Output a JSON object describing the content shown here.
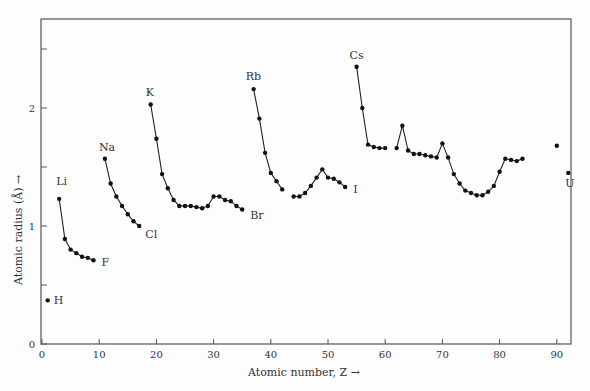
{
  "chart_data": {
    "type": "line",
    "title": "",
    "xlabel": "Atomic number, Z →",
    "ylabel": "Atomic radius (Å) →",
    "xlim": [
      0,
      93
    ],
    "ylim": [
      0,
      2.7
    ],
    "xticks": [
      0,
      10,
      20,
      30,
      40,
      50,
      60,
      70,
      80,
      90
    ],
    "yticks": [
      0,
      0.5,
      1,
      1.5,
      2,
      2.5
    ],
    "ytick_labels": [
      "0",
      "",
      "1",
      "",
      "2",
      ""
    ],
    "grid": false,
    "legend": null,
    "series": [
      {
        "name": "H",
        "x": [
          1
        ],
        "y": [
          0.37
        ]
      },
      {
        "name": "Li-F",
        "x": [
          3,
          4,
          5,
          6,
          7,
          8,
          9
        ],
        "y": [
          1.23,
          0.89,
          0.8,
          0.77,
          0.74,
          0.73,
          0.71
        ]
      },
      {
        "name": "Na-Cl",
        "x": [
          11,
          12,
          13,
          14,
          15,
          16,
          17
        ],
        "y": [
          1.57,
          1.36,
          1.25,
          1.17,
          1.1,
          1.04,
          1.0
        ]
      },
      {
        "name": "K-Br",
        "x": [
          19,
          20,
          21,
          22,
          23,
          24,
          25,
          26,
          27,
          28,
          29,
          30,
          31,
          32,
          33,
          34,
          35
        ],
        "y": [
          2.03,
          1.74,
          1.44,
          1.32,
          1.22,
          1.17,
          1.17,
          1.17,
          1.16,
          1.15,
          1.17,
          1.25,
          1.25,
          1.22,
          1.21,
          1.17,
          1.14
        ]
      },
      {
        "name": "Rb-Mo",
        "x": [
          37,
          38,
          39,
          40,
          41,
          42
        ],
        "y": [
          2.16,
          1.91,
          1.62,
          1.45,
          1.38,
          1.31
        ]
      },
      {
        "name": "Ru-I",
        "x": [
          44,
          45,
          46,
          47,
          48,
          49,
          50,
          51,
          52,
          53
        ],
        "y": [
          1.25,
          1.25,
          1.28,
          1.34,
          1.41,
          1.48,
          1.41,
          1.4,
          1.37,
          1.33
        ]
      },
      {
        "name": "Cs-Nd",
        "x": [
          55,
          56,
          57,
          58,
          59,
          60
        ],
        "y": [
          2.35,
          2.0,
          1.69,
          1.67,
          1.66,
          1.66
        ]
      },
      {
        "name": "Sm-Po",
        "x": [
          62,
          63,
          64,
          65,
          66,
          67,
          68,
          69,
          70,
          71,
          72,
          73,
          74,
          75,
          76,
          77,
          78,
          79,
          80,
          81,
          82,
          83,
          84
        ],
        "y": [
          1.66,
          1.85,
          1.64,
          1.61,
          1.61,
          1.6,
          1.59,
          1.58,
          1.7,
          1.58,
          1.44,
          1.36,
          1.3,
          1.28,
          1.26,
          1.26,
          1.29,
          1.34,
          1.46,
          1.57,
          1.56,
          1.55,
          1.57
        ]
      },
      {
        "name": "Th",
        "x": [
          90
        ],
        "y": [
          1.68
        ]
      },
      {
        "name": "U",
        "x": [
          92
        ],
        "y": [
          1.45
        ]
      }
    ],
    "annotations": [
      {
        "text": "H",
        "x": 1,
        "y": 0.37
      },
      {
        "text": "Li",
        "x": 3,
        "y": 1.23
      },
      {
        "text": "F",
        "x": 9,
        "y": 0.71
      },
      {
        "text": "Na",
        "x": 11,
        "y": 1.57
      },
      {
        "text": "Cl",
        "x": 17,
        "y": 1.0
      },
      {
        "text": "K",
        "x": 19,
        "y": 2.03
      },
      {
        "text": "Br",
        "x": 35,
        "y": 1.14
      },
      {
        "text": "Rb",
        "x": 37,
        "y": 2.16
      },
      {
        "text": "I",
        "x": 53,
        "y": 1.33
      },
      {
        "text": "Cs",
        "x": 55,
        "y": 2.35
      },
      {
        "text": "U",
        "x": 92,
        "y": 1.45
      }
    ]
  },
  "labels": {
    "xlabel": "Atomic number, Z →",
    "ylabel": "Atomic radius (Å) →"
  }
}
